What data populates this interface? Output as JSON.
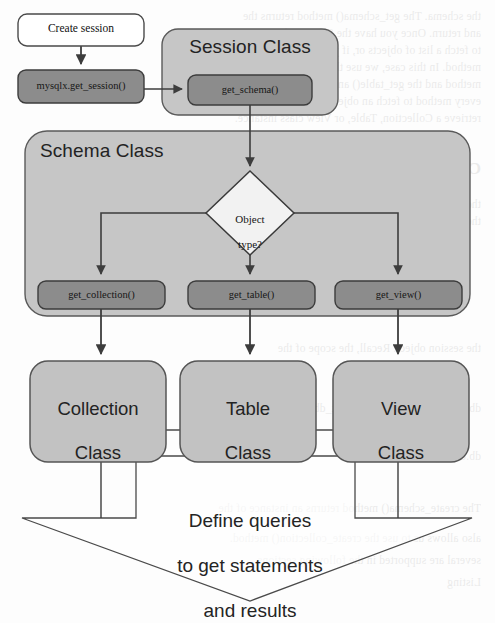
{
  "page": {
    "width": 495,
    "height": 623,
    "background_color": "#fdfdfd"
  },
  "colors": {
    "container_fill": "#c6c6c6",
    "container_stroke": "#5a5a5a",
    "method_fill": "#8c8c8c",
    "method_stroke": "#3c3c3c",
    "classbox_fill": "#c2c2c2",
    "classbox_stroke": "#555555",
    "startbox_fill": "#ffffff",
    "startbox_stroke": "#4a4a4a",
    "decision_fill": "#f2f2f2",
    "decision_stroke": "#3a3a3a",
    "connector_stroke": "#3d3d3d",
    "big_arrow_fill": "#ffffff",
    "big_arrow_stroke": "#4a4a4a",
    "text_dark": "#1d1d1d"
  },
  "nodes": {
    "start": {
      "label": "Create session",
      "shape": "rounded-rect",
      "x": 18,
      "y": 14,
      "w": 126,
      "h": 32
    },
    "session_factory": {
      "label": "mysqlx.get_session()",
      "shape": "rounded-rect",
      "x": 18,
      "y": 70,
      "w": 126,
      "h": 33
    },
    "session_class": {
      "label": "Session Class",
      "shape": "rounded-rect-container",
      "x": 162,
      "y": 29,
      "w": 176,
      "h": 86
    },
    "get_schema": {
      "label": "get_schema()",
      "shape": "rounded-rect",
      "x": 188,
      "y": 75,
      "w": 124,
      "h": 30
    },
    "schema_class": {
      "label": "Schema Class",
      "shape": "rounded-rect-container",
      "x": 25,
      "y": 131,
      "w": 445,
      "h": 185
    },
    "decision": {
      "label": "Object\ntype?",
      "label_line1": "Object",
      "label_line2": "type?",
      "shape": "diamond",
      "cx": 250,
      "cy": 213,
      "rx": 44,
      "ry": 42
    },
    "get_collection": {
      "label": "get_collection()",
      "shape": "rounded-rect",
      "x": 38,
      "y": 281,
      "w": 127,
      "h": 28
    },
    "get_table": {
      "label": "get_table()",
      "shape": "rounded-rect",
      "x": 188,
      "y": 281,
      "w": 127,
      "h": 28
    },
    "get_view": {
      "label": "get_view()",
      "shape": "rounded-rect",
      "x": 335,
      "y": 281,
      "w": 127,
      "h": 28
    },
    "collection_class": {
      "label": "Collection\nClass",
      "label_line1": "Collection",
      "label_line2": "Class",
      "shape": "rounded-rect",
      "x": 30,
      "y": 361,
      "w": 136,
      "h": 101
    },
    "table_class": {
      "label": "Table\nClass",
      "label_line1": "Table",
      "label_line2": "Class",
      "shape": "rounded-rect",
      "x": 180,
      "y": 361,
      "w": 136,
      "h": 101
    },
    "view_class": {
      "label": "View\nClass",
      "label_line1": "View",
      "label_line2": "Class",
      "shape": "rounded-rect",
      "x": 333,
      "y": 361,
      "w": 136,
      "h": 101
    },
    "big_arrow": {
      "label": "Define queries\nto get statements\nand results",
      "label_line1": "Define queries",
      "label_line2": "to get statements",
      "label_line3": "and results",
      "shape": "down-block-arrow",
      "shaft_left": 136,
      "shaft_right": 355,
      "shaft_top": 456,
      "wing_y": 518,
      "wing_left": 22,
      "wing_right": 472,
      "tip_x": 250,
      "tip_y": 601
    }
  },
  "edges": [
    {
      "from": "start",
      "to": "session_factory",
      "kind": "arrow",
      "direction": "down"
    },
    {
      "from": "session_factory",
      "to": "get_schema",
      "kind": "arrow",
      "direction": "right"
    },
    {
      "from": "get_schema",
      "to": "decision",
      "kind": "arrow",
      "direction": "down"
    },
    {
      "from": "decision",
      "to": "get_collection",
      "kind": "arrow",
      "direction": "left-down"
    },
    {
      "from": "decision",
      "to": "get_table",
      "kind": "arrow",
      "direction": "down"
    },
    {
      "from": "decision",
      "to": "get_view",
      "kind": "arrow",
      "direction": "right-down"
    },
    {
      "from": "get_collection",
      "to": "collection_class",
      "kind": "arrow",
      "direction": "down"
    },
    {
      "from": "get_table",
      "to": "table_class",
      "kind": "arrow",
      "direction": "down"
    },
    {
      "from": "get_view",
      "to": "view_class",
      "kind": "arrow",
      "direction": "down"
    },
    {
      "from": "collection_class",
      "to": "big_arrow",
      "kind": "line",
      "direction": "down"
    },
    {
      "from": "table_class",
      "to": "big_arrow",
      "kind": "line",
      "direction": "down"
    },
    {
      "from": "view_class",
      "to": "big_arrow",
      "kind": "line",
      "direction": "down"
    }
  ],
  "bleed_text": {
    "note": "faint reverse-side print showing through the scanned page",
    "lines": [
      "the schema.  The get_schema() method returns the",
      "and return. Once you have the Schema object, you",
      "to fetch a list of objects or, if you know the name",
      "method. In this case, we use the get_collection()",
      "method and the get_table() and get_view() methods",
      "every method to fetch an object of the type.",
      "retrieve a Collection, Table, or View class instance.",
      "Creating a Schema",
      "the session object. Here we can work with the",
      "the second method we can use to work with the",
      "the session object. Recall, the scope of the",
      "db = s.create_schema(\"my_test_db\")",
      "db.close()",
      "The create_schema() method returns an instance of the",
      "also allows us to use the create_collection() method.",
      "several are supported in the following sections.",
      "Listing"
    ]
  }
}
